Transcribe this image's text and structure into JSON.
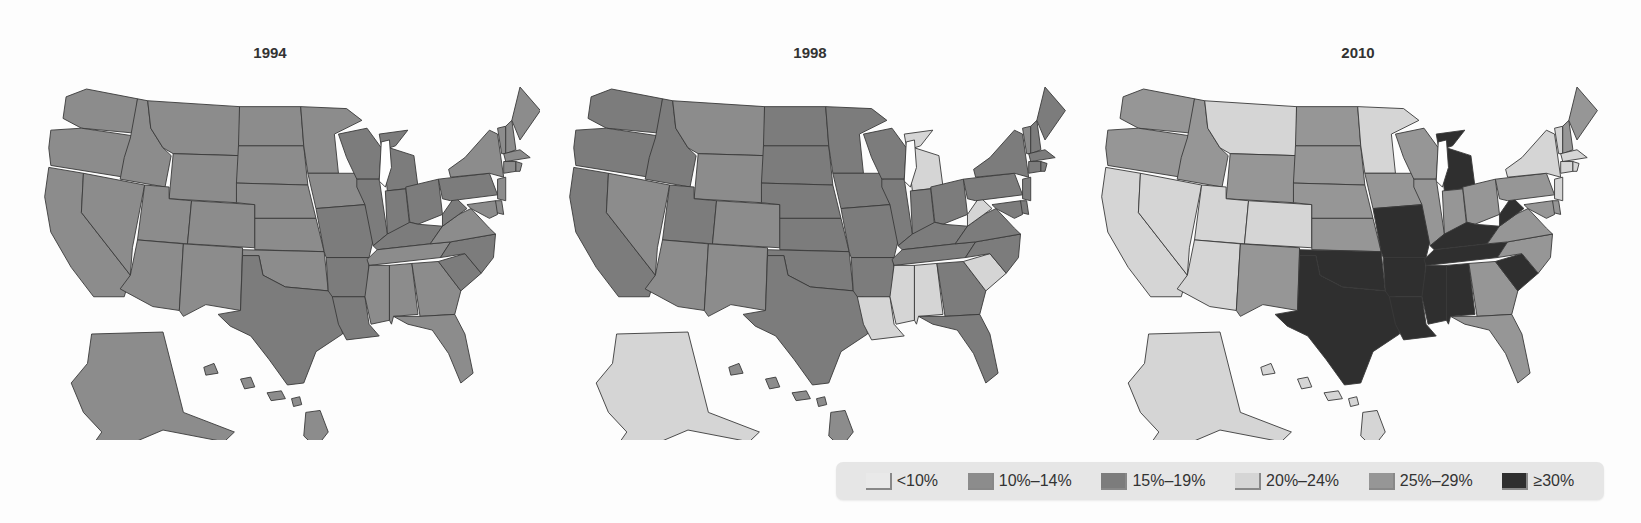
{
  "chart_data": {
    "type": "choropleth",
    "title": "",
    "colorscale": "grayscale",
    "legend": {
      "position": "bottom-right",
      "bins": [
        {
          "key": "lt10",
          "label": "<10%",
          "color": "#e9e9e9"
        },
        {
          "key": "10_14",
          "label": "10%–14%",
          "color": "#8c8c8c"
        },
        {
          "key": "15_19",
          "label": "15%–19%",
          "color": "#7c7c7c"
        },
        {
          "key": "20_24",
          "label": "20%–24%",
          "color": "#d5d5d5"
        },
        {
          "key": "25_29",
          "label": "25%–29%",
          "color": "#969696"
        },
        {
          "key": "ge30",
          "label": "≥30%",
          "color": "#2f2f2f"
        }
      ]
    },
    "maps": [
      {
        "title": "1994",
        "default_bin": "10_14",
        "states": {
          "TX": "15_19",
          "AR": "15_19",
          "LA": "15_19",
          "MO": "15_19",
          "WI": "15_19",
          "MI": "15_19",
          "IN": "15_19",
          "OH": "15_19",
          "KY": "15_19",
          "WV": "15_19",
          "PA": "15_19",
          "SC": "15_19",
          "NC": "15_19",
          "IL": "15_19"
        }
      },
      {
        "title": "1998",
        "default_bin": "15_19",
        "states": {
          "MT": "10_14",
          "WY": "10_14",
          "CO": "10_14",
          "NV": "10_14",
          "AZ": "10_14",
          "NM": "10_14",
          "VT": "10_14",
          "HI": "10_14",
          "AK": "20_24",
          "LA": "20_24",
          "MS": "20_24",
          "AL": "20_24",
          "SC": "20_24",
          "WV": "20_24",
          "MI": "20_24"
        }
      },
      {
        "title": "2010",
        "default_bin": "25_29",
        "states": {
          "CA": "20_24",
          "NV": "20_24",
          "UT": "20_24",
          "AZ": "20_24",
          "CO": "20_24",
          "MT": "20_24",
          "MN": "20_24",
          "NY": "20_24",
          "VT": "20_24",
          "MA": "20_24",
          "CT": "20_24",
          "RI": "20_24",
          "NJ": "20_24",
          "AK": "20_24",
          "HI": "20_24",
          "TX": "ge30",
          "OK": "ge30",
          "MO": "ge30",
          "AR": "ge30",
          "LA": "ge30",
          "MS": "ge30",
          "AL": "ge30",
          "TN": "ge30",
          "KY": "ge30",
          "WV": "ge30",
          "MI": "ge30",
          "SC": "ge30"
        }
      }
    ]
  }
}
